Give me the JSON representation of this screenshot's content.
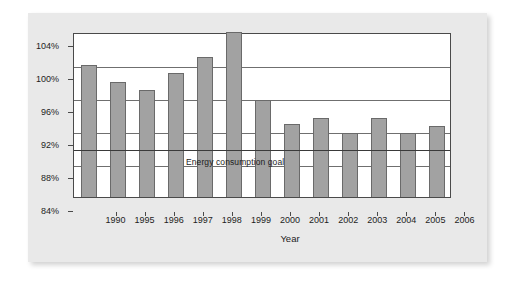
{
  "chart_data": {
    "type": "bar",
    "title": "",
    "xlabel": "Year",
    "ylabel": "",
    "categories": [
      "1990",
      "1995",
      "1996",
      "1997",
      "1998",
      "1999",
      "2000",
      "2001",
      "2002",
      "2003",
      "2004",
      "2005",
      "2006"
    ],
    "values": [
      100.0,
      98.0,
      97.0,
      99.0,
      101.0,
      104.0,
      95.8,
      92.8,
      93.6,
      91.8,
      93.6,
      91.8,
      92.6
    ],
    "ylim": [
      84,
      104
    ],
    "ytick_labels": [
      "84%",
      "88%",
      "92%",
      "96%",
      "100%",
      "104%"
    ],
    "ytick_values": [
      84,
      88,
      92,
      96,
      100,
      104
    ],
    "grid": true,
    "legend": "none",
    "annotations": [
      {
        "name": "energy-consumption-goal",
        "text": "Energy consumption goal",
        "type": "reference-line",
        "value": 90,
        "unit": "%"
      }
    ],
    "colors": {
      "bar_fill": "#a2a2a2",
      "bar_border": "#6a6a6a",
      "gridline": "#6f6f6f",
      "goal_line": "#3a3a3a",
      "plot_background": "#ffffff",
      "panel_background": "#e9e9e9",
      "text": "#1d1d1d"
    }
  }
}
